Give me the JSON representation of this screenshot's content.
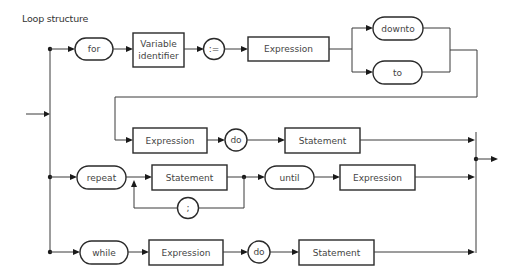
{
  "title": "Loop structure",
  "diagram": {
    "type": "syntax-diagram",
    "rows": {
      "for": {
        "keyword_for": "for",
        "variable_identifier_line1": "Variable",
        "variable_identifier_line2": "identifier",
        "assign": ":=",
        "expression1": "Expression",
        "downto": "downto",
        "to": "to",
        "expression2": "Expression",
        "do": "do",
        "statement": "Statement"
      },
      "repeat": {
        "keyword_repeat": "repeat",
        "statement": "Statement",
        "separator": ";",
        "keyword_until": "until",
        "expression": "Expression"
      },
      "while": {
        "keyword_while": "while",
        "expression": "Expression",
        "do": "do",
        "statement": "Statement"
      }
    }
  }
}
